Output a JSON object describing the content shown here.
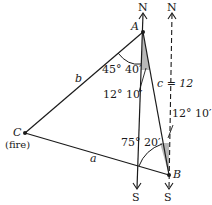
{
  "figure": {
    "points": {
      "A": {
        "label": "A"
      },
      "B": {
        "label": "B"
      },
      "C": {
        "label": "C",
        "sublabel": "(fire)"
      }
    },
    "sides": {
      "a": {
        "label": "a"
      },
      "b": {
        "label": "b"
      },
      "c": {
        "label": "c = 12"
      }
    },
    "directions": {
      "north_left": "N",
      "north_right": "N",
      "south_left": "S",
      "south_right": "S"
    },
    "angles": {
      "at_A_CAB": "45° 40′",
      "at_A_bearing": "12° 10′",
      "at_B_bearing": "12° 10′",
      "at_B_CBS": "75° 20′"
    },
    "colors": {
      "line": "#1a1a1a",
      "shade": "#b8b8b8"
    }
  }
}
